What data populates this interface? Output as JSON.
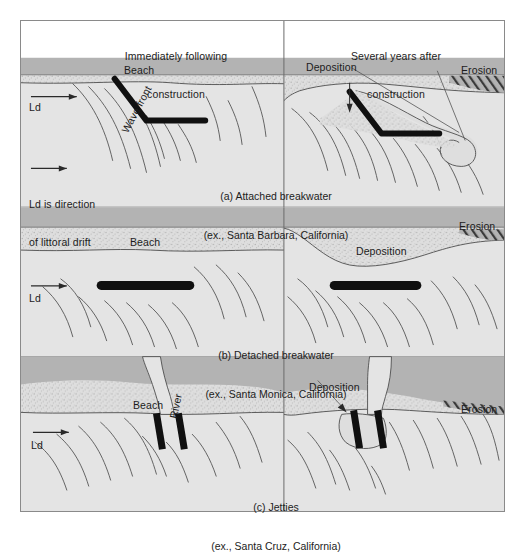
{
  "figure": {
    "title_artifact": "",
    "columns": [
      {
        "id": "left",
        "line1": "Immediately following",
        "line2": "construction"
      },
      {
        "id": "right",
        "line1": "Several years after",
        "line2": "construction"
      }
    ],
    "legend": {
      "ld_symbol": "Ld",
      "ld_note_line1": "Ld is direction",
      "ld_note_line2": "of littoral drift",
      "wave_front_label": "Wave front"
    },
    "rows": [
      {
        "id": "a",
        "caption_line1": "(a) Attached breakwater",
        "caption_line2": "(ex., Santa Barbara, California)",
        "left_labels": [
          "Beach",
          "Ld"
        ],
        "right_labels": [
          "Deposition",
          "Erosion"
        ],
        "structure": "attached-breakwater"
      },
      {
        "id": "b",
        "caption_line1": "(b) Detached breakwater",
        "caption_line2": "(ex., Santa Monica, California)",
        "left_labels": [
          "Beach",
          "Ld"
        ],
        "right_labels": [
          "Deposition",
          "Erosion"
        ],
        "structure": "detached-breakwater"
      },
      {
        "id": "c",
        "caption_line1": "(c) Jetties",
        "caption_line2": "(ex., Santa Cruz, California)",
        "left_labels": [
          "Beach",
          "River",
          "Ld"
        ],
        "right_labels": [
          "Deposition",
          "Erosion"
        ],
        "structure": "jetties"
      }
    ],
    "colors": {
      "land_dark": "#b3b3b3",
      "beach_sand": "#dcdcdc",
      "water": "#e4e4e4",
      "structure_black": "#101010",
      "frame_stroke": "#8a8a8a",
      "line_stroke": "#555555",
      "header_bg": "#ffffff",
      "text": "#1c1c1c"
    },
    "icons": {
      "arrow": "ld-arrow-icon",
      "deposition_arrow": "deposition-arrow-icon",
      "erosion_hatch": "erosion-hatch-icon"
    }
  }
}
